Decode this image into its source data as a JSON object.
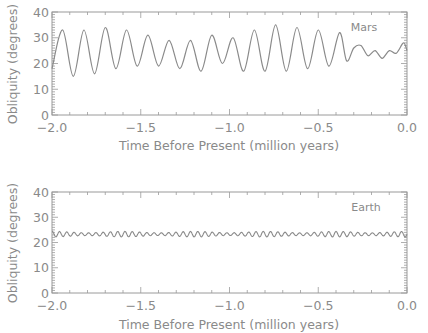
{
  "colors": {
    "axis": "#9a9a9a",
    "line": "#8a8a8a",
    "text": "#8a8a8a",
    "background": "#ffffff"
  },
  "chart_data": [
    {
      "type": "line",
      "panel": "top",
      "label": "Mars",
      "xlabel": "Time Before Present (million years)",
      "ylabel": "Obliquity (degrees)",
      "xlim": [
        -2.0,
        0.0
      ],
      "ylim": [
        0,
        40
      ],
      "xticks": [
        "-2.0",
        "-1.5",
        "-1.0",
        "-0.5",
        "0.0"
      ],
      "yticks": [
        "0",
        "10",
        "20",
        "30",
        "40"
      ],
      "grid": false,
      "series": [
        {
          "name": "Mars obliquity",
          "x": [
            -2.0,
            -1.94,
            -1.88,
            -1.82,
            -1.76,
            -1.7,
            -1.64,
            -1.58,
            -1.52,
            -1.46,
            -1.4,
            -1.34,
            -1.28,
            -1.22,
            -1.16,
            -1.1,
            -1.04,
            -0.98,
            -0.92,
            -0.86,
            -0.8,
            -0.74,
            -0.68,
            -0.62,
            -0.56,
            -0.5,
            -0.44,
            -0.38,
            -0.34,
            -0.3,
            -0.26,
            -0.22,
            -0.18,
            -0.14,
            -0.1,
            -0.06,
            -0.02,
            0.0
          ],
          "values": [
            18,
            33,
            15,
            33,
            16,
            34,
            18,
            33,
            19,
            31,
            19,
            29,
            18,
            29,
            17,
            31,
            20,
            30,
            17,
            33,
            17,
            35,
            17,
            34,
            18,
            33,
            19,
            32,
            21,
            26,
            27,
            23,
            25,
            22,
            25,
            24,
            28,
            25
          ]
        }
      ]
    },
    {
      "type": "line",
      "panel": "bottom",
      "label": "Earth",
      "xlabel": "Time Before Present (million years)",
      "ylabel": "Obliquity (degrees)",
      "xlim": [
        -2.0,
        0.0
      ],
      "ylim": [
        0,
        40
      ],
      "xticks": [
        "-2.0",
        "-1.5",
        "-1.0",
        "-0.5",
        "0.0"
      ],
      "yticks": [
        "0",
        "10",
        "20",
        "30",
        "40"
      ],
      "grid": false,
      "series": [
        {
          "name": "Earth obliquity",
          "period_myr": 0.041,
          "mean": 23.3,
          "amplitude": 1.1,
          "range": [
            22.1,
            24.5
          ]
        }
      ]
    }
  ],
  "panels": {
    "top": {
      "label": "Mars",
      "xlabel": "Time Before Present (million years)",
      "ylabel": "Obliquity (degrees)"
    },
    "bottom": {
      "label": "Earth",
      "xlabel": "Time Before Present (million years)",
      "ylabel": "Obliquity (degrees)"
    }
  }
}
